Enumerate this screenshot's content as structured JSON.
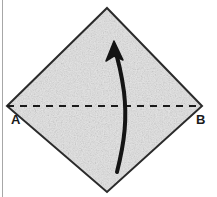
{
  "figure": {
    "background_color": "#ffffff"
  },
  "sheet": {
    "name": "paper-sheet",
    "shape": "diamond",
    "fill_color": "#e3e3e3",
    "stroke_color": "#2b2b2b",
    "stroke_width": 2,
    "texture": "speckled-gray-paper",
    "vertices": {
      "top": {
        "x": 107,
        "y": 8
      },
      "right": {
        "x": 202,
        "y": 106
      },
      "bottom": {
        "x": 107,
        "y": 192
      },
      "left": {
        "x": 7,
        "y": 106
      }
    }
  },
  "fold_line": {
    "name": "fold-line",
    "style": "dashed",
    "color": "#1a1a1a",
    "stroke_width": 2,
    "dash_pattern": "7 6",
    "from": {
      "x": 7,
      "y": 106
    },
    "to": {
      "x": 202,
      "y": 106
    }
  },
  "labels": {
    "left_vertex": "A",
    "right_vertex": "B"
  },
  "arrow": {
    "name": "fold-direction-arrow",
    "color": "#141414",
    "stroke_width": 4,
    "direction": "upward",
    "tail": {
      "x": 117,
      "y": 172
    },
    "head": {
      "x": 114,
      "y": 44
    }
  },
  "border": {
    "name": "left-edge-rule",
    "color": "#8a8a8a",
    "x": 2,
    "width": 1
  },
  "colors": {
    "paper": "#e3e3e3",
    "ink": "#1a1a1a",
    "background": "#ffffff",
    "edge_rule": "#8a8a8a"
  }
}
